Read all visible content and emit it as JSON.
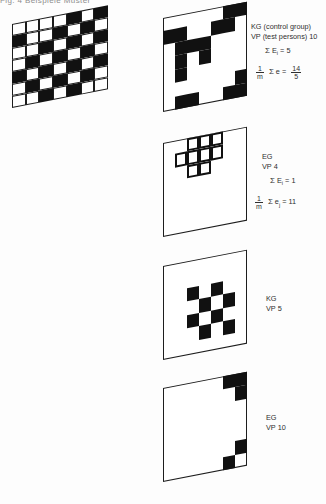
{
  "document": {
    "top_truncated_text": "Fig. 4  Beispiele  Muster",
    "background_color": "#fdfdfd",
    "ink_color": "#111111"
  },
  "panels": [
    {
      "id": "reference-grid",
      "name": "reference-pattern-grid",
      "style": "gridlines",
      "rows": 7,
      "cols": 7,
      "black_cells": [
        [
          0,
          4
        ],
        [
          0,
          6
        ],
        [
          1,
          0
        ],
        [
          1,
          3
        ],
        [
          1,
          5
        ],
        [
          2,
          2
        ],
        [
          2,
          4
        ],
        [
          2,
          6
        ],
        [
          3,
          1
        ],
        [
          3,
          3
        ],
        [
          3,
          5
        ],
        [
          4,
          0
        ],
        [
          4,
          2
        ],
        [
          4,
          4
        ],
        [
          4,
          6
        ],
        [
          5,
          1
        ],
        [
          5,
          3
        ],
        [
          5,
          5
        ],
        [
          6,
          2
        ],
        [
          6,
          4
        ]
      ],
      "label": ""
    },
    {
      "id": "panel-1",
      "name": "panel-kg-vp-10",
      "style": "blocks",
      "rows": 7,
      "cols": 7,
      "black_cells": [
        [
          0,
          5
        ],
        [
          0,
          6
        ],
        [
          1,
          0
        ],
        [
          1,
          1
        ],
        [
          1,
          4
        ],
        [
          1,
          5
        ],
        [
          2,
          1
        ],
        [
          2,
          2
        ],
        [
          2,
          3
        ],
        [
          3,
          1
        ],
        [
          3,
          3
        ],
        [
          4,
          1
        ],
        [
          5,
          6
        ],
        [
          6,
          1
        ],
        [
          6,
          2
        ],
        [
          6,
          5
        ],
        [
          6,
          6
        ]
      ]
    },
    {
      "id": "panel-2",
      "name": "panel-eg-vp-4",
      "style": "outline-cluster",
      "rows": 7,
      "cols": 7,
      "outline_cells": [
        [
          0,
          2
        ],
        [
          0,
          3
        ],
        [
          0,
          4
        ],
        [
          1,
          1
        ],
        [
          1,
          2
        ],
        [
          1,
          3
        ],
        [
          1,
          4
        ],
        [
          2,
          2
        ],
        [
          2,
          3
        ]
      ]
    },
    {
      "id": "panel-3",
      "name": "panel-kg-vp-5",
      "style": "blocks",
      "rows": 7,
      "cols": 7,
      "black_cells": [
        [
          2,
          2
        ],
        [
          2,
          4
        ],
        [
          3,
          3
        ],
        [
          3,
          5
        ],
        [
          4,
          2
        ],
        [
          4,
          4
        ],
        [
          5,
          3
        ],
        [
          5,
          5
        ]
      ]
    },
    {
      "id": "panel-4",
      "name": "panel-eg-vp-10",
      "style": "blocks",
      "rows": 7,
      "cols": 7,
      "black_cells": [
        [
          0,
          5
        ],
        [
          0,
          6
        ],
        [
          1,
          6
        ],
        [
          5,
          6
        ],
        [
          6,
          5
        ]
      ]
    }
  ],
  "annotations": {
    "a1": {
      "line1": "KG (control group)",
      "line2": "VP (test persons) 10",
      "eq1_sigma": "Σ",
      "eq1_var": "E",
      "eq1_sub": "i",
      "eq1_eq": "=",
      "eq1_val": "5",
      "eq2_frac_num": "1",
      "eq2_frac_den": "m",
      "eq2_sigma": "Σ",
      "eq2_var": "e",
      "eq2_eq": "=",
      "eq2_res_num": "14",
      "eq2_res_den": "5"
    },
    "a2": {
      "line1": "EG",
      "line2": "VP 4",
      "eq1_sigma": "Σ",
      "eq1_var": "E",
      "eq1_sub": "i",
      "eq1_eq": "=",
      "eq1_val": "1",
      "eq2_frac_num": "1",
      "eq2_frac_den": "m",
      "eq2_sigma": "Σ",
      "eq2_var": "e",
      "eq2_sub": "j",
      "eq2_eq": "=",
      "eq2_val": "11"
    },
    "a3": {
      "line1": "KG",
      "line2": "VP 5"
    },
    "a4": {
      "line1": "EG",
      "line2": "VP 10"
    }
  }
}
